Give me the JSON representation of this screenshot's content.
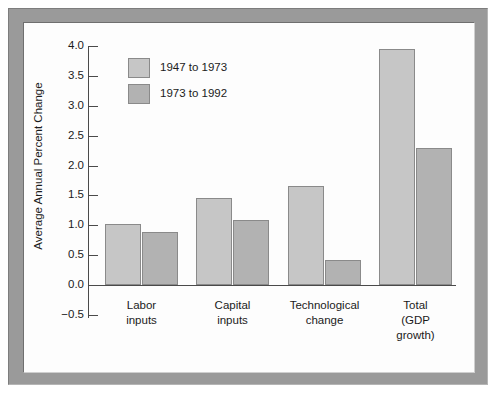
{
  "chart_data": {
    "type": "bar",
    "title": "",
    "xlabel": "",
    "ylabel": "Average Annual Percent Change",
    "ylim": [
      -0.5,
      4.0
    ],
    "yticks": [
      "4.0",
      "3.5",
      "3.0",
      "2.5",
      "2.0",
      "1.5",
      "1.0",
      "0.5",
      "0.0",
      "-0.5"
    ],
    "ytick_values": [
      4.0,
      3.5,
      3.0,
      2.5,
      2.0,
      1.5,
      1.0,
      0.5,
      0.0,
      -0.5
    ],
    "grid": false,
    "legend_position": "top-left-inside",
    "categories": [
      "Labor inputs",
      "Capital inputs",
      "Technological change",
      "Total (GDP growth)"
    ],
    "category_lines": [
      [
        "Labor",
        "inputs"
      ],
      [
        "Capital",
        "inputs"
      ],
      [
        "Technological",
        "change"
      ],
      [
        "Total",
        "(GDP",
        "growth)"
      ]
    ],
    "series": [
      {
        "name": "1947 to 1973",
        "color": "#c6c6c6",
        "values": [
          1.02,
          1.46,
          1.65,
          3.95
        ]
      },
      {
        "name": "1973 to 1992",
        "color": "#b2b2b2",
        "values": [
          0.88,
          1.08,
          0.42,
          2.3
        ]
      }
    ]
  }
}
